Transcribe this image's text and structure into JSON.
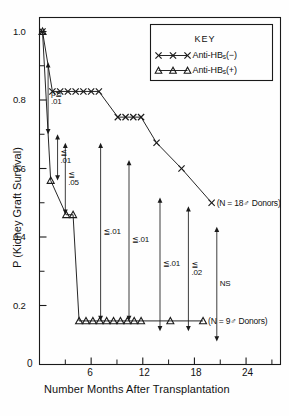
{
  "chart_data": {
    "type": "line",
    "title": "",
    "xlabel": "Number Months After Transplantation",
    "ylabel": "P (Kidney Graft Survival)",
    "xlim": [
      0,
      28
    ],
    "ylim": [
      0.0,
      1.05
    ],
    "xticks_major": [
      0,
      6,
      12,
      18,
      24
    ],
    "xticks_major_labels": [
      "0",
      "6",
      "12",
      "18",
      "24"
    ],
    "xticks_minor": [
      3,
      9,
      15,
      21,
      27
    ],
    "yticks_major": [
      0.2,
      0.4,
      0.6,
      0.8,
      1.0
    ],
    "yticks_major_labels": [
      "0.2",
      "0.4",
      "0.6",
      "0.8",
      "1.0"
    ],
    "yticks_minor": [
      0.3,
      0.5,
      0.7,
      0.9
    ],
    "grid": false,
    "legend_position": "top-right",
    "series": [
      {
        "name": "Anti-HBs(−)",
        "marker": "x",
        "label": "(N = 18♂ Donors)",
        "points": [
          [
            0.35,
            1.0
          ],
          [
            1.5,
            0.825
          ],
          [
            2.4,
            0.825
          ],
          [
            3.3,
            0.825
          ],
          [
            4.2,
            0.825
          ],
          [
            5.1,
            0.825
          ],
          [
            6.0,
            0.825
          ],
          [
            6.9,
            0.825
          ],
          [
            9.1,
            0.75
          ],
          [
            10.0,
            0.75
          ],
          [
            10.9,
            0.75
          ],
          [
            11.8,
            0.75
          ],
          [
            13.6,
            0.675
          ],
          [
            16.5,
            0.6
          ],
          [
            20.0,
            0.5
          ]
        ]
      },
      {
        "name": "Anti-HBs(+)",
        "marker": "triangle",
        "label": "(N = 9♂ Donors)",
        "points": [
          [
            0.35,
            1.0
          ],
          [
            1.3,
            0.565
          ],
          [
            3.1,
            0.465
          ],
          [
            3.9,
            0.465
          ],
          [
            4.6,
            0.155
          ],
          [
            5.4,
            0.155
          ],
          [
            6.2,
            0.155
          ],
          [
            7.0,
            0.155
          ],
          [
            7.8,
            0.155
          ],
          [
            8.6,
            0.155
          ],
          [
            9.4,
            0.155
          ],
          [
            10.2,
            0.155
          ],
          [
            11.0,
            0.155
          ],
          [
            11.8,
            0.155
          ],
          [
            15.2,
            0.155
          ],
          [
            19.0,
            0.155
          ]
        ]
      }
    ],
    "annotations": [
      {
        "id": "p-le-01",
        "text_line1": "p≦",
        "text_line2": ".01",
        "x": 1.0,
        "y_from": 0.7,
        "y_to": 0.91
      },
      {
        "id": "le-01-a",
        "text_line1": "≦",
        "text_line2": ".01",
        "x": 2.1,
        "y_from": 0.565,
        "y_to": 0.7
      },
      {
        "id": "le-05",
        "text_line1": "≦",
        "text_line2": ".05",
        "x": 3.0,
        "y_from": 0.465,
        "y_to": 0.675
      },
      {
        "id": "le-01-b",
        "text_line1": "≦.01",
        "text_line2": "",
        "x": 7.1,
        "y_from": 0.155,
        "y_to": 0.675
      },
      {
        "id": "le-01-c",
        "text_line1": "≦.01",
        "text_line2": "",
        "x": 10.4,
        "y_from": 0.155,
        "y_to": 0.625
      },
      {
        "id": "le-01-d",
        "text_line1": "≦.01",
        "text_line2": "",
        "x": 14.0,
        "y_from": 0.125,
        "y_to": 0.515
      },
      {
        "id": "le-02",
        "text_line1": "≦",
        "text_line2": ".02",
        "x": 17.3,
        "y_from": 0.125,
        "y_to": 0.49
      },
      {
        "id": "ns",
        "text_line1": "NS",
        "text_line2": "",
        "x": 20.6,
        "y_from": 0.095,
        "y_to": 0.43
      }
    ]
  },
  "legend": {
    "title": "KEY",
    "entries": [
      {
        "marker": "x",
        "label_main": "Anti-HB",
        "label_sub": "s",
        "label_tail": "(−)"
      },
      {
        "marker": "triangle",
        "label_main": "Anti-HB",
        "label_sub": "s",
        "label_tail": "(+)"
      }
    ]
  },
  "colors": {
    "ink": "#1a1a1a",
    "background": "#fefefe"
  }
}
